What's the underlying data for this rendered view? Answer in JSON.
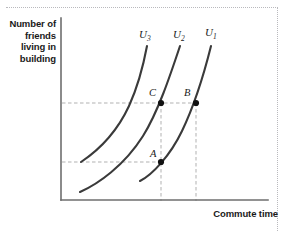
{
  "chart_data": {
    "type": "line",
    "title": "",
    "xlabel": "Commute time",
    "ylabel": "Number of friends living in building",
    "grid": false,
    "legend_position": "inline-curve-end",
    "series": [
      {
        "name": "U3",
        "label": "U",
        "subscript": "3",
        "path": "M 81 162 C 96 152, 116 134, 129 106 C 139 84, 144 62, 147 46"
      },
      {
        "name": "U2",
        "label": "U",
        "subscript": "2",
        "path": "M 80 192 C 98 184, 124 166, 143 136 C 158 112, 170 76, 180 46"
      },
      {
        "name": "U1",
        "label": "U",
        "subscript": "1",
        "path": "M 140 181 C 152 175, 170 156, 182 131 C 194 106, 205 70, 211 46"
      }
    ],
    "points": [
      {
        "name": "A",
        "label": "A",
        "x": 161,
        "y": 162,
        "label_dx": -11,
        "label_dy": -14
      },
      {
        "name": "B",
        "label": "B",
        "x": 196,
        "y": 103,
        "label_dx": -12,
        "label_dy": -16
      },
      {
        "name": "C",
        "label": "C",
        "x": 161,
        "y": 103,
        "label_dx": -12,
        "label_dy": -16
      }
    ],
    "guide_lines": [
      {
        "name": "horizontal-upper",
        "orientation": "horizontal",
        "from": [
          62,
          103
        ],
        "to": [
          198,
          103
        ]
      },
      {
        "name": "horizontal-lower",
        "orientation": "horizontal",
        "from": [
          62,
          162
        ],
        "to": [
          162,
          162
        ]
      },
      {
        "name": "vertical-c",
        "orientation": "vertical",
        "from": [
          161,
          103
        ],
        "to": [
          161,
          201
        ]
      },
      {
        "name": "vertical-b",
        "orientation": "vertical",
        "from": [
          196,
          103
        ],
        "to": [
          196,
          201
        ]
      }
    ],
    "axes": {
      "x_axis": {
        "from": [
          61,
          200
        ],
        "to": [
          268,
          200
        ]
      },
      "y_axis": {
        "from": [
          61,
          18
        ],
        "to": [
          61,
          200
        ]
      },
      "x_ticks": [],
      "y_ticks": []
    },
    "curve_label_positions": [
      {
        "name": "U3",
        "x": 139,
        "y": 28
      },
      {
        "name": "U2",
        "x": 173,
        "y": 28
      },
      {
        "name": "U1",
        "x": 205,
        "y": 26
      }
    ],
    "colors": {
      "curve": "#3a3a3a",
      "axis": "#6e6e6e",
      "guide": "#a8a8a8",
      "text": "#1a1a1a",
      "point": "#111111",
      "background": "#ffffff",
      "page_rule": "#b9b9bd"
    }
  }
}
